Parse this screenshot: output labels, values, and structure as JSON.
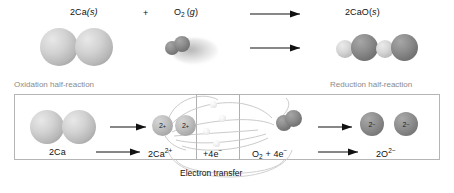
{
  "figure": {
    "overall_equation": "2Ca(s) + O2(g) -> 2CaO(s)"
  },
  "top_reaction": {
    "reactant_1": {
      "formula": "2Ca",
      "state": "(s)",
      "state_italic": "s"
    },
    "plus_sign": "+",
    "reactant_2": {
      "formula": "O",
      "subscript": "2",
      "state": "(g)",
      "state_italic": "g"
    },
    "product": {
      "formula": "2CaO",
      "state": "(s)",
      "state_italic": "s"
    },
    "arrow_label": "yields"
  },
  "half_reaction_labels": {
    "oxidation": "Oxidation half-reaction",
    "reduction": "Reduction half-reaction"
  },
  "bottom_panel": {
    "oxidation_reactant": "2Ca",
    "oxidation_product": {
      "text": "2Ca",
      "superscript": "2+"
    },
    "electron_term": {
      "text": "+4e",
      "superscript": "−"
    },
    "reduction_reactant": {
      "text": "O",
      "subscript": "2",
      "plus": " + 4e",
      "superscript": "−"
    },
    "reduction_product": {
      "text": "2O",
      "superscript": "2−"
    },
    "electron_transfer_caption": "Electron transfer"
  },
  "sphere_labels": {
    "calcium_ion_charge": "2+",
    "oxide_ion_charge": "2−"
  },
  "colors": {
    "calcium_light": "#d2d2d2",
    "oxygen_dark": "#8e8e8e",
    "panel_border": "#b5b5b5",
    "label_gray": "#8a8a8a",
    "text_black": "#1a1a1a",
    "electron_white": "#ffffff",
    "arc_gray": "#bdbdbd",
    "background": "#ffffff"
  }
}
